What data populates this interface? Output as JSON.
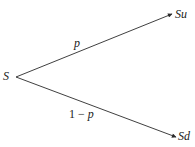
{
  "diagram": {
    "type": "binomial-tree",
    "root": {
      "label": "S"
    },
    "branches": [
      {
        "target": "Su",
        "probability": "p"
      },
      {
        "target": "Sd",
        "probability_prefix": "1 − ",
        "probability_var": "p"
      }
    ],
    "colors": {
      "line": "#2a2a2a",
      "text": "#1a1a1a",
      "background": "#ffffff"
    }
  }
}
